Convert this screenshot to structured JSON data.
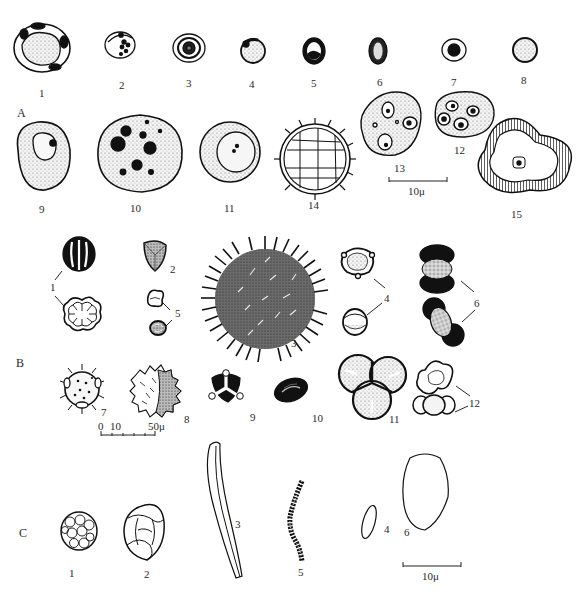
{
  "plate": {
    "sections": [
      {
        "id": "A",
        "label": "A"
      },
      {
        "id": "B",
        "label": "B"
      },
      {
        "id": "C",
        "label": "C"
      }
    ],
    "section_a": {
      "figures": [
        {
          "n": "1"
        },
        {
          "n": "2"
        },
        {
          "n": "3"
        },
        {
          "n": "4"
        },
        {
          "n": "5"
        },
        {
          "n": "6"
        },
        {
          "n": "7"
        },
        {
          "n": "8"
        },
        {
          "n": "9"
        },
        {
          "n": "10"
        },
        {
          "n": "11"
        },
        {
          "n": "12"
        },
        {
          "n": "13"
        },
        {
          "n": "14"
        },
        {
          "n": "15"
        }
      ],
      "scale_bar": {
        "label": "10μ"
      }
    },
    "section_b": {
      "figures": [
        {
          "n": "1"
        },
        {
          "n": "2"
        },
        {
          "n": "3"
        },
        {
          "n": "4"
        },
        {
          "n": "5"
        },
        {
          "n": "6"
        },
        {
          "n": "7"
        },
        {
          "n": "8"
        },
        {
          "n": "9"
        },
        {
          "n": "10"
        },
        {
          "n": "11"
        },
        {
          "n": "12"
        }
      ],
      "scale_bar": {
        "ticks": [
          "0",
          "10",
          "50μ"
        ]
      }
    },
    "section_c": {
      "figures": [
        {
          "n": "1"
        },
        {
          "n": "2"
        },
        {
          "n": "3"
        },
        {
          "n": "4"
        },
        {
          "n": "5"
        },
        {
          "n": "6"
        }
      ],
      "scale_bar": {
        "label": "10μ"
      }
    }
  }
}
